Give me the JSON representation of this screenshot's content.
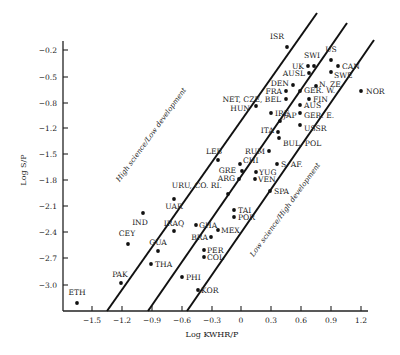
{
  "chart_data": {
    "type": "scatter",
    "title": "",
    "xlabel": "Log KWHR/P",
    "ylabel": "Log S/P",
    "x_ticks": [
      "-1.5",
      "-1.2",
      "-0.9",
      "-0.6",
      "-0.3",
      "0",
      "0.3",
      "0.6",
      "0.9",
      "1.2"
    ],
    "y_ticks": [
      "-0.2",
      "-0.5",
      "-0.8",
      "-1.2",
      "-1.5",
      "-1.8",
      "-2.1",
      "-2.4",
      "-2.7",
      "-3.0"
    ],
    "xlim": [
      -1.65,
      1.25
    ],
    "ylim": [
      -3.3,
      -0.05
    ],
    "grid": false,
    "legend": null,
    "annotations": [
      {
        "text": "High science/Low development",
        "position": "upper-left diagonal band"
      },
      {
        "text": "Low science/High development",
        "position": "lower-right diagonal band"
      }
    ],
    "reference_lines": [
      {
        "name": "upper boundary",
        "from": [
          -1.32,
          -3.2
        ],
        "to": [
          0.77,
          -0.05
        ]
      },
      {
        "name": "middle trend",
        "from": [
          -0.93,
          -3.2
        ],
        "to": [
          1.07,
          -0.1
        ]
      },
      {
        "name": "lower boundary",
        "from": [
          -0.54,
          -3.2
        ],
        "to": [
          1.33,
          -0.32
        ]
      }
    ],
    "points": [
      {
        "label": "ISR",
        "x": 0.45,
        "y": -0.15,
        "px": 287,
        "py": 47
      },
      {
        "label": "US",
        "x": 0.9,
        "y": -0.25,
        "px": 331,
        "py": 60
      },
      {
        "label": "SWI",
        "x": 0.6,
        "y": -0.35,
        "px": 314,
        "py": 66
      },
      {
        "label": "UK",
        "x": 0.6,
        "y": -0.45,
        "px": 308,
        "py": 66
      },
      {
        "label": "CAN",
        "x": 0.97,
        "y": -0.4,
        "px": 338,
        "py": 66
      },
      {
        "label": "AUSL",
        "x": 0.6,
        "y": -0.55,
        "px": 309,
        "py": 73
      },
      {
        "label": "SWE",
        "x": 0.9,
        "y": -0.55,
        "px": 331,
        "py": 72
      },
      {
        "label": "DEN",
        "x": 0.42,
        "y": -0.75,
        "px": 293,
        "py": 85
      },
      {
        "label": "N. ZE.",
        "x": 0.65,
        "y": -0.75,
        "px": 316,
        "py": 86
      },
      {
        "label": "FRA",
        "x": 0.42,
        "y": -0.85,
        "px": 286,
        "py": 91
      },
      {
        "label": "GER. W.",
        "x": 0.55,
        "y": -0.85,
        "px": 300,
        "py": 91
      },
      {
        "label": "NOR",
        "x": 1.23,
        "y": -0.85,
        "px": 361,
        "py": 91
      },
      {
        "label": "NET, CZE, BEL",
        "x": 0.42,
        "y": -0.95,
        "px": 286,
        "py": 99
      },
      {
        "label": "FIN",
        "x": 0.68,
        "y": -0.95,
        "px": 309,
        "py": 99
      },
      {
        "label": "HUN",
        "x": 0.2,
        "y": -1.05,
        "px": 256,
        "py": 106
      },
      {
        "label": "AUS",
        "x": 0.62,
        "y": -1.1,
        "px": 300,
        "py": 105
      },
      {
        "label": "IRE",
        "x": 0.38,
        "y": -1.15,
        "px": 271,
        "py": 113
      },
      {
        "label": "GER. E.",
        "x": 0.62,
        "y": -1.2,
        "px": 300,
        "py": 113
      },
      {
        "label": "JAP",
        "x": 0.46,
        "y": -1.3,
        "px": 280,
        "py": 121
      },
      {
        "label": "ITA",
        "x": 0.35,
        "y": -1.45,
        "px": 278,
        "py": 132
      },
      {
        "label": "USSR",
        "x": 0.6,
        "y": -1.45,
        "px": 300,
        "py": 125
      },
      {
        "label": "BUL, POL",
        "x": 0.4,
        "y": -1.55,
        "px": 279,
        "py": 138
      },
      {
        "label": "RUM",
        "x": 0.2,
        "y": -1.7,
        "px": 269,
        "py": 151
      },
      {
        "label": "LEB",
        "x": -0.2,
        "y": -1.95,
        "px": 218,
        "py": 160
      },
      {
        "label": "CHI",
        "x": 0.05,
        "y": -1.9,
        "px": 240,
        "py": 164
      },
      {
        "label": "S. AF.",
        "x": 0.4,
        "y": -1.95,
        "px": 277,
        "py": 164
      },
      {
        "label": "GRE",
        "x": 0.1,
        "y": -2.05,
        "px": 242,
        "py": 171
      },
      {
        "label": "YUG",
        "x": 0.3,
        "y": -2.0,
        "px": 256,
        "py": 172
      },
      {
        "label": "ARG",
        "x": 0.05,
        "y": -2.1,
        "px": 239,
        "py": 179
      },
      {
        "label": "VEN",
        "x": 0.25,
        "y": -2.1,
        "px": 255,
        "py": 179
      },
      {
        "label": "SPA",
        "x": 0.45,
        "y": -2.25,
        "px": 270,
        "py": 191
      },
      {
        "label": "URU, CO. RI.",
        "x": -0.15,
        "y": -2.3,
        "px": 228,
        "py": 194
      },
      {
        "label": "TAI",
        "x": 0.0,
        "y": -2.35,
        "px": 234,
        "py": 210
      },
      {
        "label": "POR",
        "x": 0.0,
        "y": -2.45,
        "px": 234,
        "py": 217
      },
      {
        "label": "UAR",
        "x": -0.75,
        "y": -2.2,
        "px": 174,
        "py": 199
      },
      {
        "label": "IND",
        "x": -1.0,
        "y": -2.35,
        "px": 143,
        "py": 213
      },
      {
        "label": "GHA",
        "x": -0.45,
        "y": -2.55,
        "px": 196,
        "py": 225
      },
      {
        "label": "IRAQ",
        "x": -0.75,
        "y": -2.5,
        "px": 174,
        "py": 231
      },
      {
        "label": "MEX",
        "x": -0.25,
        "y": -2.6,
        "px": 218,
        "py": 230
      },
      {
        "label": "BRA",
        "x": -0.35,
        "y": -2.65,
        "px": 211,
        "py": 237
      },
      {
        "label": "CEY",
        "x": -1.15,
        "y": -2.65,
        "px": 128,
        "py": 244
      },
      {
        "label": "GUA",
        "x": -0.85,
        "y": -2.75,
        "px": 158,
        "py": 251
      },
      {
        "label": "PER",
        "x": -0.35,
        "y": -2.8,
        "px": 204,
        "py": 250
      },
      {
        "label": "COL",
        "x": -0.35,
        "y": -2.9,
        "px": 204,
        "py": 257
      },
      {
        "label": "THA",
        "x": -0.95,
        "y": -2.95,
        "px": 151,
        "py": 264
      },
      {
        "label": "PHI",
        "x": -0.65,
        "y": -3.05,
        "px": 182,
        "py": 277
      },
      {
        "label": "PAK",
        "x": -1.2,
        "y": -3.1,
        "px": 121,
        "py": 283
      },
      {
        "label": "KOR",
        "x": -0.5,
        "y": -3.2,
        "px": 198,
        "py": 290
      },
      {
        "label": "ETH",
        "x": -1.6,
        "y": -3.3,
        "px": 77,
        "py": 303
      }
    ]
  },
  "labels": {
    "xlabel": "Log KWHR/P",
    "ylabel": "Log S/P",
    "band_upper": "High science/Low development",
    "band_lower": "Low science/High development"
  }
}
